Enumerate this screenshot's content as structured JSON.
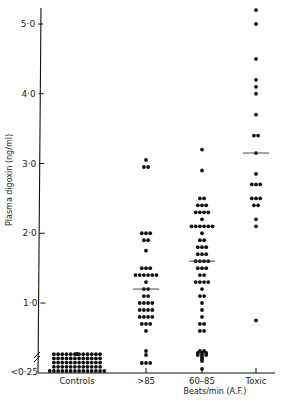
{
  "chart_data": {
    "type": "scatter",
    "subtype": "dot-plot",
    "title": "",
    "xlabel": "Beats/min (A.F.)",
    "ylabel": "Plasma digoxin (ng/ml)",
    "ylim": [
      0.25,
      5.25
    ],
    "y_ticks": [
      {
        "value": 5.0,
        "label": "5·0"
      },
      {
        "value": 4.0,
        "label": "4·0"
      },
      {
        "value": 3.0,
        "label": "3·0"
      },
      {
        "value": 2.0,
        "label": "2·0"
      },
      {
        "value": 1.0,
        "label": "1·0"
      },
      {
        "value": 0.25,
        "label": "<0·25"
      }
    ],
    "axis_break": true,
    "grid": false,
    "legend": null,
    "categories": [
      "Controls",
      ">85",
      "60–85",
      "Toxic"
    ],
    "series": [
      {
        "name": "Controls",
        "median": null,
        "rows": [
          {
            "y": 0.57,
            "n": 1
          },
          {
            "y": 0.47,
            "n": 12
          },
          {
            "y": 0.42,
            "n": 12
          },
          {
            "y": 0.37,
            "n": 12
          },
          {
            "y": 0.32,
            "n": 12
          },
          {
            "y": 0.27,
            "n": 14
          }
        ]
      },
      {
        "name": ">85",
        "median": 1.2,
        "rows": [
          {
            "y": 3.05,
            "n": 1
          },
          {
            "y": 2.95,
            "n": 2
          },
          {
            "y": 2.0,
            "n": 3
          },
          {
            "y": 1.9,
            "n": 2
          },
          {
            "y": 1.75,
            "n": 1
          },
          {
            "y": 1.5,
            "n": 3
          },
          {
            "y": 1.4,
            "n": 6
          },
          {
            "y": 1.3,
            "n": 1
          },
          {
            "y": 1.2,
            "n": 2
          },
          {
            "y": 1.1,
            "n": 2
          },
          {
            "y": 1.0,
            "n": 4
          },
          {
            "y": 0.9,
            "n": 4
          },
          {
            "y": 0.8,
            "n": 4
          },
          {
            "y": 0.7,
            "n": 3
          },
          {
            "y": 0.6,
            "n": 1
          },
          {
            "y": 0.5,
            "n": 1
          },
          {
            "y": 0.4,
            "n": 1
          },
          {
            "y": 0.2,
            "n": 3
          }
        ]
      },
      {
        "name": "60–85",
        "median": 1.6,
        "rows": [
          {
            "y": 3.2,
            "n": 1
          },
          {
            "y": 2.9,
            "n": 1
          },
          {
            "y": 2.5,
            "n": 2
          },
          {
            "y": 2.4,
            "n": 3
          },
          {
            "y": 2.3,
            "n": 4
          },
          {
            "y": 2.2,
            "n": 1
          },
          {
            "y": 2.1,
            "n": 6
          },
          {
            "y": 2.0,
            "n": 1
          },
          {
            "y": 1.9,
            "n": 2
          },
          {
            "y": 1.8,
            "n": 3
          },
          {
            "y": 1.7,
            "n": 3
          },
          {
            "y": 1.6,
            "n": 4
          },
          {
            "y": 1.5,
            "n": 3
          },
          {
            "y": 1.4,
            "n": 2
          },
          {
            "y": 1.3,
            "n": 4
          },
          {
            "y": 1.2,
            "n": 1
          },
          {
            "y": 1.1,
            "n": 2
          },
          {
            "y": 1.0,
            "n": 1
          },
          {
            "y": 0.9,
            "n": 1
          },
          {
            "y": 0.8,
            "n": 1
          },
          {
            "y": 0.7,
            "n": 2
          },
          {
            "y": 0.6,
            "n": 2
          },
          {
            "y": 0.5,
            "n": 2
          },
          {
            "y": 0.4,
            "n": 3
          },
          {
            "y": 0.3,
            "n": 1
          },
          {
            "y": 0.05,
            "n": 1
          },
          {
            "y": 0.45,
            "n": 3
          },
          {
            "y": 0.35,
            "n": 1
          },
          {
            "y": 0.25,
            "n": 1
          }
        ]
      },
      {
        "name": "Toxic",
        "median": 3.15,
        "rows": [
          {
            "y": 5.2,
            "n": 1
          },
          {
            "y": 5.0,
            "n": 1
          },
          {
            "y": 4.5,
            "n": 1
          },
          {
            "y": 4.2,
            "n": 1
          },
          {
            "y": 4.1,
            "n": 1
          },
          {
            "y": 4.0,
            "n": 1
          },
          {
            "y": 3.7,
            "n": 1
          },
          {
            "y": 3.4,
            "n": 2
          },
          {
            "y": 3.15,
            "n": 1
          },
          {
            "y": 2.85,
            "n": 1
          },
          {
            "y": 2.7,
            "n": 3
          },
          {
            "y": 2.5,
            "n": 3
          },
          {
            "y": 2.4,
            "n": 2
          },
          {
            "y": 2.2,
            "n": 1
          },
          {
            "y": 2.1,
            "n": 1
          },
          {
            "y": 0.75,
            "n": 1
          }
        ]
      }
    ]
  }
}
